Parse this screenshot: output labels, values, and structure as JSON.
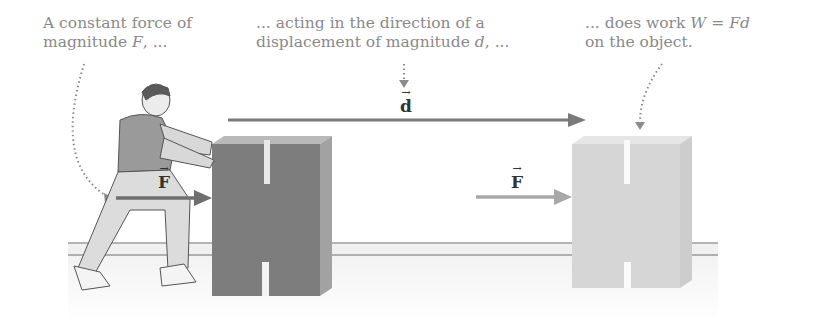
{
  "captions": {
    "force": {
      "line1": "A constant force of",
      "line2_pre": "magnitude ",
      "line2_var": "F",
      "line2_post": ", ..."
    },
    "displacement": {
      "line1": "... acting in the direction of a",
      "line2_pre": "displacement of magnitude ",
      "line2_var": "d",
      "line2_post": ", ..."
    },
    "work": {
      "line1_pre": "... does work ",
      "line1_eq": "W = Fd",
      "line2": "on the object."
    }
  },
  "vectors": {
    "displacement": {
      "symbol": "d",
      "arrow": "→"
    },
    "force_left": {
      "symbol": "F",
      "arrow": "→"
    },
    "force_right": {
      "symbol": "F",
      "arrow": "→"
    }
  },
  "colors": {
    "caption_text": "#8a8a8a",
    "block_initial": "#7d7d7d",
    "block_final": "#d6d6d6",
    "arrow_dark": "#7a7a7a",
    "arrow_light": "#a8a8a8",
    "floor_line": "#9a9a9a"
  }
}
